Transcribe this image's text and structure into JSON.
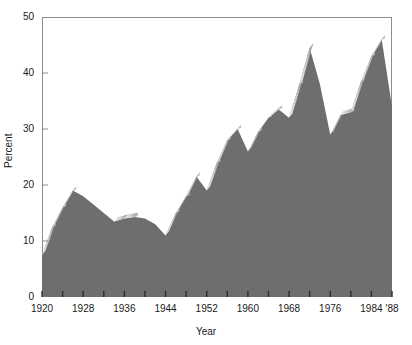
{
  "chart_data": {
    "type": "area",
    "title": "",
    "xlabel": "Year",
    "ylabel": "Percent",
    "xlim": [
      1920,
      1988
    ],
    "ylim": [
      0,
      50
    ],
    "grid": false,
    "legend": "none",
    "style": "3d-ribbon-area",
    "fill_color": "#6e6e6e",
    "highlight_color": "#d8d8d8",
    "axis_color": "#8c8c8c",
    "ytick_labels": [
      "0",
      "10",
      "20",
      "30",
      "40",
      "50"
    ],
    "ytick_values": [
      0,
      10,
      20,
      30,
      40,
      50
    ],
    "xtick_labels": [
      "1920",
      "1928",
      "1936",
      "1944",
      "1952",
      "1960",
      "1968",
      "1976",
      "1984",
      "'88"
    ],
    "xtick_label_values": [
      1920,
      1928,
      1936,
      1944,
      1952,
      1960,
      1968,
      1976,
      1984,
      1988
    ],
    "xtick_values": [
      1920,
      1924,
      1928,
      1932,
      1936,
      1940,
      1944,
      1948,
      1952,
      1956,
      1960,
      1964,
      1968,
      1972,
      1976,
      1980,
      1984,
      1988
    ],
    "x": [
      1920,
      1922,
      1924,
      1926,
      1928,
      1930,
      1932,
      1934,
      1936,
      1938,
      1940,
      1942,
      1944,
      1946,
      1948,
      1950,
      1952,
      1954,
      1956,
      1958,
      1960,
      1962,
      1964,
      1966,
      1968,
      1970,
      1972,
      1974,
      1976,
      1978,
      1980,
      1982,
      1984,
      1986,
      1988
    ],
    "values": [
      7.5,
      12.5,
      16.0,
      19.0,
      18.0,
      16.5,
      15.0,
      13.5,
      14.0,
      14.3,
      14.0,
      13.0,
      11.0,
      15.0,
      18.0,
      21.5,
      19.0,
      24.0,
      28.0,
      30.0,
      26.0,
      29.5,
      32.0,
      33.5,
      32.0,
      38.0,
      44.5,
      38.0,
      29.0,
      32.5,
      33.0,
      38.5,
      43.0,
      46.0,
      34.0
    ]
  }
}
